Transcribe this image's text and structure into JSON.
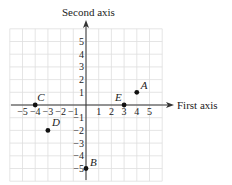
{
  "diagram": {
    "type": "coordinate-plane",
    "x_axis_label": "First axis",
    "y_axis_label": "Second axis",
    "x_range": [
      -6,
      6
    ],
    "y_range": [
      -6,
      6
    ],
    "grid": true,
    "x_tick_labels": [
      "−5",
      "−4",
      "−3",
      "−2",
      "−1",
      "1",
      "2",
      "3",
      "4",
      "5"
    ],
    "x_tick_values": [
      -5,
      -4,
      -3,
      -2,
      -1,
      1,
      2,
      3,
      4,
      5
    ],
    "y_tick_labels": [
      "5",
      "4",
      "3",
      "2",
      "1",
      "−1",
      "−2",
      "−3",
      "−4",
      "−5"
    ],
    "y_tick_values": [
      5,
      4,
      3,
      2,
      1,
      -1,
      -2,
      -3,
      -4,
      -5
    ],
    "points": [
      {
        "label": "A",
        "x": 4,
        "y": 1
      },
      {
        "label": "B",
        "x": 0,
        "y": -5
      },
      {
        "label": "C",
        "x": -4,
        "y": 0
      },
      {
        "label": "D",
        "x": -3,
        "y": -2
      },
      {
        "label": "E",
        "x": 3,
        "y": 0
      }
    ],
    "colors": {
      "grid": "#dedede",
      "axis": "#333333",
      "point": "#111111",
      "text": "#222222"
    }
  }
}
